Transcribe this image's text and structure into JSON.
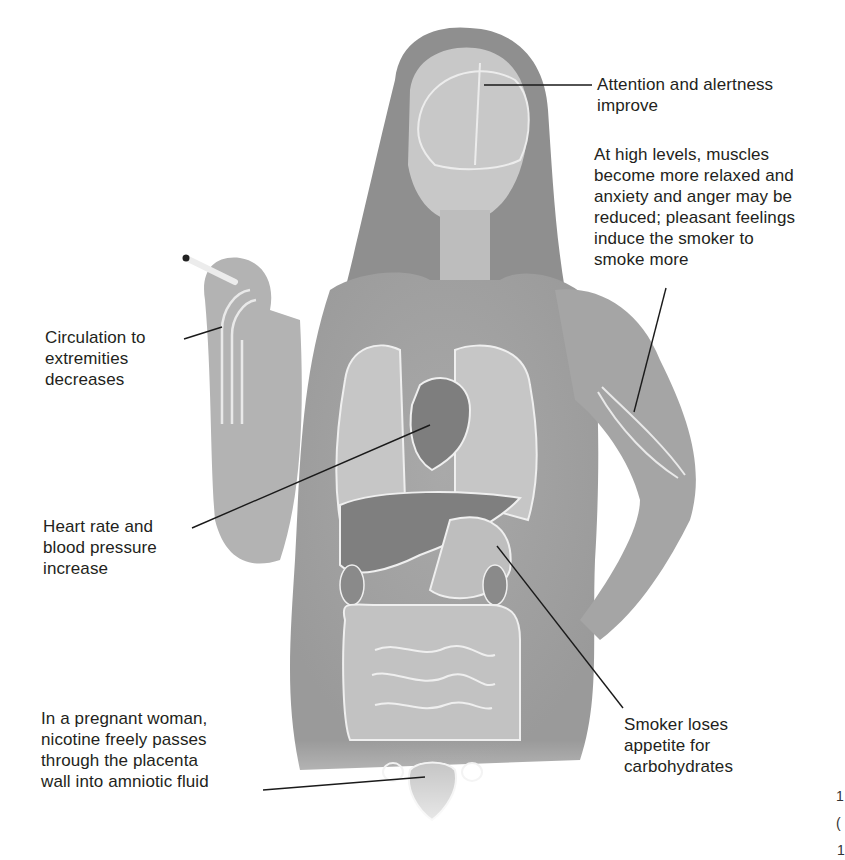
{
  "figure": {
    "colors": {
      "background": "#ffffff",
      "skin": "#b9b9b9",
      "shirt": "#a8a8a8",
      "hair": "#8e8e8e",
      "organ_light": "#c4c4c4",
      "organ_dark": "#7d7d7d",
      "organ_outline": "#eeeeee",
      "leader_line": "#1a1a1a",
      "text": "#231f20"
    }
  },
  "callouts": [
    {
      "id": "brain",
      "lines": [
        "Attention and alertness",
        "improve"
      ]
    },
    {
      "id": "muscles",
      "lines": [
        "At high levels, muscles",
        "become more relaxed and",
        "anxiety and anger may be",
        "reduced; pleasant feelings",
        "induce the smoker to",
        "smoke more"
      ]
    },
    {
      "id": "circulation",
      "lines": [
        "Circulation to",
        "extremities",
        "decreases"
      ]
    },
    {
      "id": "heart",
      "lines": [
        "Heart rate and",
        "blood pressure",
        "increase"
      ]
    },
    {
      "id": "pregnancy",
      "lines": [
        "In a pregnant woman,",
        "nicotine freely passes",
        "through the placenta",
        "wall into amniotic fluid"
      ]
    },
    {
      "id": "appetite",
      "lines": [
        "Smoker loses",
        "appetite for",
        "carbohydrates"
      ]
    }
  ],
  "edge_fragments": [
    "1",
    "(",
    "1"
  ]
}
